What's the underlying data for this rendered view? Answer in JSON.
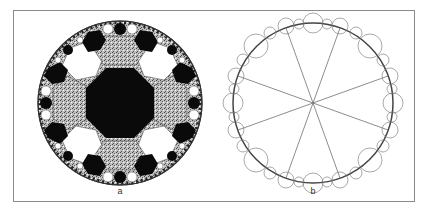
{
  "figure": {
    "panels": [
      {
        "id": "a",
        "label": "a",
        "description": "Hyperbolic tiling of the Poincaré disk with octagons shaded black, stippled grey and white"
      },
      {
        "id": "b",
        "label": "b",
        "description": "Poincaré disk line drawing: 8 diameters through center and nested boundary arcs"
      }
    ],
    "colors": {
      "frame": "#8a8a8a",
      "black_tile": "#0a0a0a",
      "stipple_tile": "#a8a8a8",
      "white_tile": "#ffffff",
      "line": "#707070"
    }
  }
}
